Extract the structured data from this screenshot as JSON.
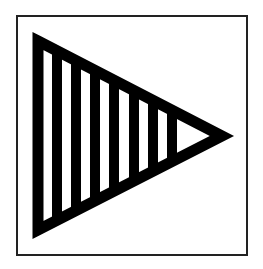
{
  "symbol": {
    "label": "Striped right-pointing triangle in square frame",
    "frame": {
      "x": 17,
      "y": 16,
      "width": 230,
      "height": 239,
      "stroke": "#222222",
      "stroke_width": 2
    },
    "triangle": {
      "points": [
        [
          33,
          33
        ],
        [
          231,
          136
        ],
        [
          33,
          238
        ]
      ],
      "color": "#000000",
      "outline_width": 10
    },
    "stripes": {
      "count": 9,
      "color": "#000000",
      "x_positions": [
        33,
        52,
        71,
        90,
        109,
        129,
        148,
        167,
        176
      ],
      "width": 10
    },
    "colors": {
      "background": "#ffffff",
      "ink": "#000000"
    }
  }
}
